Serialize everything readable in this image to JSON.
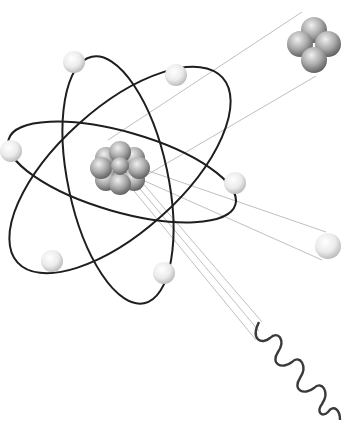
{
  "diagram": {
    "colors": {
      "background": "#ffffff",
      "orbit": "#1e1e1e",
      "emission_line": "#b8b8b8",
      "electron_light": "#ffffff",
      "electron_dark": "#c8c8c8",
      "nucleon_light": "#e6e6e6",
      "nucleon_dark": "#6e6e6e",
      "gamma_wave": "#3a3a3a"
    },
    "orbits": [
      {
        "name": "orbit-tilted-left",
        "cx": 118,
        "cy": 212,
        "rx": 58,
        "ry": 130,
        "rotate": -18
      },
      {
        "name": "orbit-tilted-right",
        "cx": 112,
        "cy": 176,
        "rx": 66,
        "ry": 138,
        "rotate": 42
      },
      {
        "name": "orbit-horizontal",
        "cx": 124,
        "cy": 170,
        "rx": 122,
        "ry": 46,
        "rotate": 14
      }
    ],
    "electrons": [
      {
        "x": 74,
        "y": 62
      },
      {
        "x": 176,
        "y": 75
      },
      {
        "x": 11,
        "y": 151
      },
      {
        "x": 235,
        "y": 183
      },
      {
        "x": 52,
        "y": 261
      },
      {
        "x": 164,
        "y": 273
      }
    ],
    "nucleus": {
      "x": 120,
      "y": 166
    },
    "emissions": {
      "alpha": {
        "label": "alpha particle",
        "x": 314,
        "y": 44
      },
      "beta": {
        "label": "beta particle",
        "x": 328,
        "y": 246
      },
      "gamma": {
        "label": "gamma ray",
        "start_x": 259,
        "start_y": 322,
        "end_x": 340,
        "end_y": 420
      }
    }
  }
}
